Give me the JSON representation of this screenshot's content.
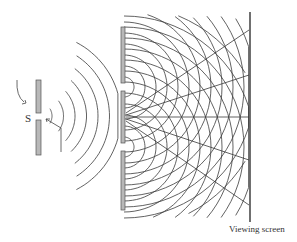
{
  "diagram": {
    "labels": {
      "source": "S",
      "screen": "Viewing screen"
    },
    "colors": {
      "wave": "#3a3a3a",
      "barrier_fill": "#b8b8b8",
      "barrier_stroke": "#555555",
      "screen": "#222222"
    },
    "source_slit": {
      "x": 36,
      "gap_y": 116,
      "top": [
        80,
        113
      ],
      "bottom": [
        120,
        155
      ]
    },
    "double_slit_barrier": {
      "x": 121,
      "slit_y": [
        87,
        147
      ],
      "segments": [
        [
          27,
          83
        ],
        [
          91,
          143
        ],
        [
          151,
          210
        ]
      ]
    },
    "screen_line": {
      "x": 250,
      "y1": 12,
      "y2": 222
    },
    "incoming_wavefronts": 7,
    "diffracted_wavefronts_per_slit": 9
  }
}
